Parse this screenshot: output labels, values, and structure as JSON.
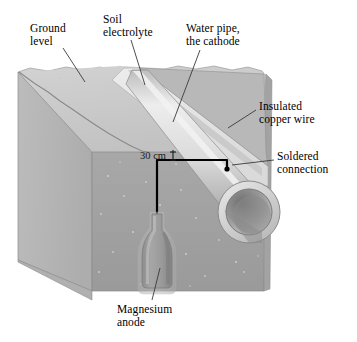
{
  "diagram": {
    "type": "cutaway-isometric-illustration",
    "labels": {
      "ground_level": "Ground\nlevel",
      "soil_electrolyte": "Soil\nelectrolyte",
      "water_pipe": "Water pipe,\nthe cathode",
      "insulated_copper_wire": "Insulated\ncopper wire",
      "soldered_connection": "Soldered\nconnection",
      "magnesium_anode": "Magnesium\nanode"
    },
    "dimension": {
      "value": "30 cm",
      "measures": "burial depth of the copper wire below ground level"
    },
    "colors": {
      "soil_top_face": "#c9c9c9",
      "soil_left_face": "#b4b4b4",
      "soil_front_face": "#a0a0a0",
      "trench_backfill": "#e2e2e2",
      "pipe_body": "#d8d8d8",
      "pipe_bore": "#8e8e8e",
      "anode_body": "#9a9a9a",
      "wire": "#000000",
      "leader_line": "#3a3a3a",
      "background": "#ffffff"
    },
    "icons": {
      "magnesium_anode": "bottle-shaped-anode",
      "water_pipe": "cylindrical-pipe",
      "wire": "right-angle-wire-path"
    }
  }
}
